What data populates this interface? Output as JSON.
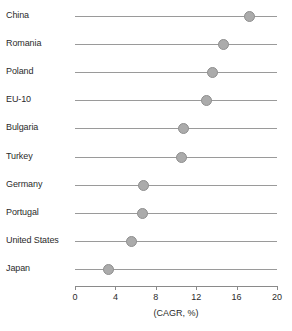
{
  "chart_data": {
    "type": "scatter",
    "title": "",
    "subtitle": "",
    "xlabel": "(CAGR, %)",
    "ylabel": "",
    "xlim": [
      0,
      20
    ],
    "xticks": [
      0,
      4,
      8,
      12,
      16,
      20
    ],
    "xtick_labels": [
      "0",
      "4",
      "8",
      "12",
      "16",
      "20"
    ],
    "grid": false,
    "legend": null,
    "orientation": "horizontal",
    "categories": [
      "China",
      "Romania",
      "Poland",
      "EU-10",
      "Bulgaria",
      "Turkey",
      "Germany",
      "Portugal",
      "United States",
      "Japan"
    ],
    "values": [
      17.3,
      14.7,
      13.6,
      13.0,
      10.7,
      10.5,
      6.8,
      6.7,
      5.6,
      3.3
    ],
    "points": [
      {
        "category": "China",
        "value": 17.3
      },
      {
        "category": "Romania",
        "value": 14.7
      },
      {
        "category": "Poland",
        "value": 13.6
      },
      {
        "category": "EU-10",
        "value": 13.0
      },
      {
        "category": "Bulgaria",
        "value": 10.7
      },
      {
        "category": "Turkey",
        "value": 10.5
      },
      {
        "category": "Germany",
        "value": 6.8
      },
      {
        "category": "Portugal",
        "value": 6.7
      },
      {
        "category": "United States",
        "value": 5.6
      },
      {
        "category": "Japan",
        "value": 3.3
      }
    ],
    "marker_color": "#ababab",
    "marker_edge_color": "#8f8f8f",
    "line_color": "#9a9a9a",
    "axis_color": "#8a8a8a",
    "text_color": "#2b2b2b",
    "background_color": "#ffffff"
  }
}
